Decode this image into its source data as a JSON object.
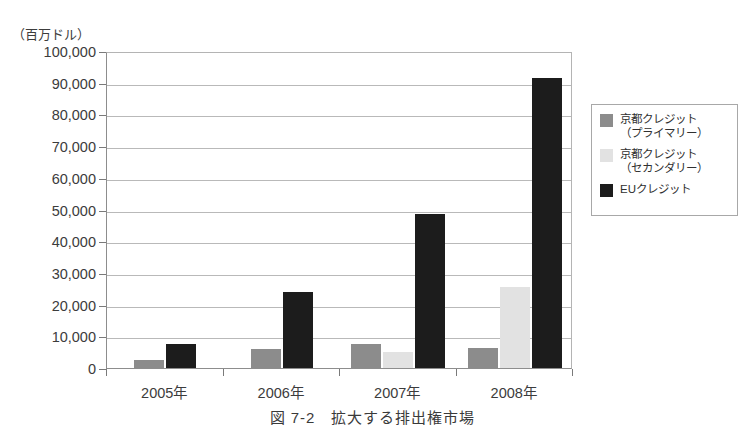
{
  "figure": {
    "unit_label": "（百万ドル）",
    "caption": "図 7-2　拡大する排出権市場"
  },
  "legend": {
    "items": [
      {
        "label": "京都クレジット\n（プライマリー）",
        "color": "#8c8c8c",
        "key": "primary"
      },
      {
        "label": "京都クレジット\n（セカンダリー）",
        "color": "#e2e2e2",
        "key": "secondary"
      },
      {
        "label": "EUクレジット",
        "color": "#1c1c1c",
        "key": "eu"
      }
    ]
  },
  "chart_data": {
    "type": "bar",
    "title": "図 7-2　拡大する排出権市場",
    "xlabel": "",
    "ylabel": "（百万ドル）",
    "ylim": [
      0,
      100000
    ],
    "ytick_labels": [
      "100,000",
      "90,000",
      "80,000",
      "70,000",
      "60,000",
      "50,000",
      "40,000",
      "30,000",
      "20,000",
      "10,000",
      "0"
    ],
    "ytick_values": [
      100000,
      90000,
      80000,
      70000,
      60000,
      50000,
      40000,
      30000,
      20000,
      10000,
      0
    ],
    "grid": true,
    "legend_position": "right",
    "categories": [
      "2005年",
      "2006年",
      "2007年",
      "2008年"
    ],
    "series": [
      {
        "name": "京都クレジット（プライマリー）",
        "color": "#8c8c8c",
        "values": [
          2500,
          6000,
          7600,
          6400
        ]
      },
      {
        "name": "京都クレジット（セカンダリー）",
        "color": "#e2e2e2",
        "values": [
          0,
          0,
          5000,
          25500
        ]
      },
      {
        "name": "EUクレジット",
        "color": "#1c1c1c",
        "values": [
          7500,
          24000,
          48500,
          91500
        ]
      }
    ]
  }
}
